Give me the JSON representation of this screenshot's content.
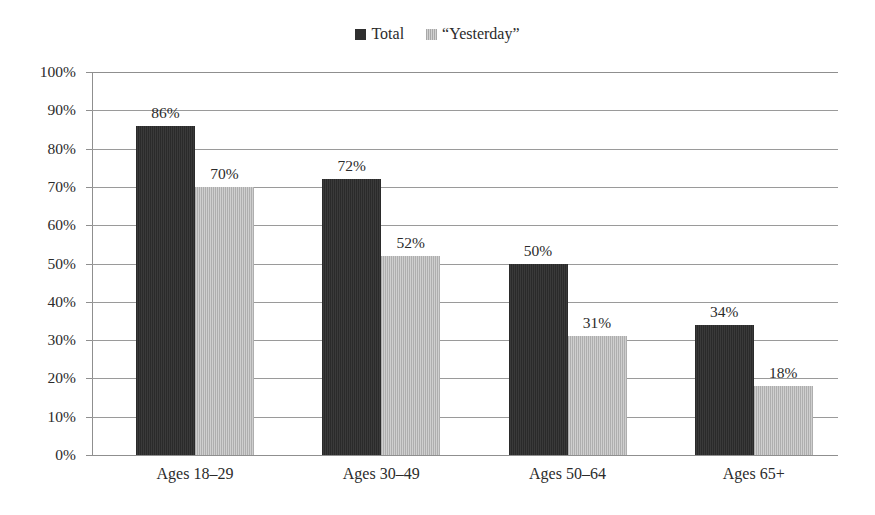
{
  "chart_data": {
    "type": "bar",
    "title": "",
    "subtitle": "",
    "xlabel": "",
    "ylabel": "",
    "ylim": [
      0,
      100
    ],
    "ytick_suffix": "%",
    "grid": true,
    "legend_position": "top-center",
    "categories": [
      "Ages 18–29",
      "Ages 30–49",
      "Ages 50–64",
      "Ages 65+"
    ],
    "yticks": [
      "0%",
      "10%",
      "20%",
      "30%",
      "40%",
      "50%",
      "60%",
      "70%",
      "80%",
      "90%",
      "100%"
    ],
    "ytick_values": [
      0,
      10,
      20,
      30,
      40,
      50,
      60,
      70,
      80,
      90,
      100
    ],
    "series": [
      {
        "name": "Total",
        "color": "#2f2f2f",
        "values": [
          86,
          72,
          50,
          34
        ],
        "labels": [
          "86%",
          "72%",
          "50%",
          "34%"
        ]
      },
      {
        "name": "“Yesterday”",
        "color": "#bcbcbc",
        "values": [
          70,
          52,
          31,
          18
        ],
        "labels": [
          "70%",
          "52%",
          "31%",
          "18%"
        ]
      }
    ]
  },
  "legend": {
    "items": [
      {
        "label": "Total",
        "swatch": "total-swatch-icon"
      },
      {
        "label": "“Yesterday”",
        "swatch": "yesterday-swatch-icon"
      }
    ]
  },
  "axes": {
    "y": {
      "ticks": [
        "100%",
        "90%",
        "80%",
        "70%",
        "60%",
        "50%",
        "40%",
        "30%",
        "20%",
        "10%",
        "0%"
      ]
    },
    "x": {
      "ticks": [
        "Ages 18–29",
        "Ages 30–49",
        "Ages 50–64",
        "Ages 65+"
      ]
    }
  },
  "colors": {
    "total": "#2f2f2f",
    "yesterday": "#bcbcbc",
    "gridline": "#9a9a9a",
    "axis": "#8f8f8f",
    "text": "#2b2b2b",
    "background": "#ffffff"
  }
}
